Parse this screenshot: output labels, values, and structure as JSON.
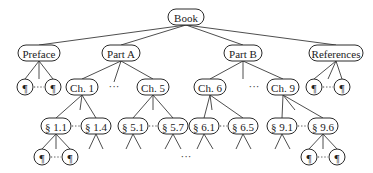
{
  "diagram": {
    "type": "tree",
    "colors": {
      "stroke": "#2a2a2a",
      "text": "#222222",
      "background": "#ffffff"
    },
    "root": {
      "id": "book",
      "label": "Book",
      "x": 186,
      "y": 17,
      "w": 36
    },
    "level1": [
      {
        "id": "preface",
        "label": "Preface",
        "x": 39,
        "y": 53,
        "w": 42
      },
      {
        "id": "part-a",
        "label": "Part A",
        "x": 121,
        "y": 53,
        "w": 38
      },
      {
        "id": "part-b",
        "label": "Part B",
        "x": 243,
        "y": 53,
        "w": 38
      },
      {
        "id": "references",
        "label": "References",
        "x": 336,
        "y": 53,
        "w": 54
      }
    ],
    "level2": [
      {
        "id": "pref-p1",
        "label": "¶",
        "x": 25,
        "y": 87,
        "w": 16
      },
      {
        "id": "pref-p2",
        "label": "¶",
        "x": 53,
        "y": 87,
        "w": 16
      },
      {
        "id": "ch1",
        "label": "Ch. 1",
        "x": 82,
        "y": 87,
        "w": 32
      },
      {
        "id": "ch5",
        "label": "Ch. 5",
        "x": 153,
        "y": 87,
        "w": 32
      },
      {
        "id": "ch6",
        "label": "Ch. 6",
        "x": 210,
        "y": 87,
        "w": 32
      },
      {
        "id": "ch9",
        "label": "Ch. 9",
        "x": 283,
        "y": 87,
        "w": 32
      },
      {
        "id": "ref-p1",
        "label": "¶",
        "x": 314,
        "y": 87,
        "w": 16
      },
      {
        "id": "ref-p2",
        "label": "¶",
        "x": 342,
        "y": 87,
        "w": 16
      }
    ],
    "level3": [
      {
        "id": "s1-1",
        "label": "§ 1.1",
        "x": 56,
        "y": 126,
        "w": 30
      },
      {
        "id": "s1-4",
        "label": "§ 1.4",
        "x": 96,
        "y": 126,
        "w": 30
      },
      {
        "id": "s5-1",
        "label": "§ 5.1",
        "x": 133,
        "y": 126,
        "w": 30
      },
      {
        "id": "s5-7",
        "label": "§ 5.7",
        "x": 173,
        "y": 126,
        "w": 30
      },
      {
        "id": "s6-1",
        "label": "§ 6.1",
        "x": 204,
        "y": 126,
        "w": 30
      },
      {
        "id": "s6-5",
        "label": "§ 6.5",
        "x": 243,
        "y": 126,
        "w": 30
      },
      {
        "id": "s9-1",
        "label": "§ 9.1",
        "x": 282,
        "y": 126,
        "w": 30
      },
      {
        "id": "s9-6",
        "label": "§ 9.6",
        "x": 323,
        "y": 126,
        "w": 30
      }
    ],
    "level4": [
      {
        "id": "s11-p1",
        "label": "¶",
        "x": 42,
        "y": 157,
        "w": 16
      },
      {
        "id": "s11-p2",
        "label": "¶",
        "x": 70,
        "y": 157,
        "w": 16
      },
      {
        "id": "s96-p1",
        "label": "¶",
        "x": 309,
        "y": 157,
        "w": 16
      },
      {
        "id": "s96-p2",
        "label": "¶",
        "x": 337,
        "y": 157,
        "w": 16
      }
    ],
    "ellipses": [
      {
        "id": "parta-dots",
        "label": "···",
        "x": 114,
        "y": 90
      },
      {
        "id": "partb-dots",
        "label": "···",
        "x": 254,
        "y": 90
      },
      {
        "id": "bottom-dots",
        "label": "···",
        "x": 186,
        "y": 160
      }
    ],
    "dotted_links": [
      {
        "from": "pref-p1",
        "to": "pref-p2"
      },
      {
        "from": "ref-p1",
        "to": "ref-p2"
      },
      {
        "from": "s1-1",
        "to": "s1-4"
      },
      {
        "from": "s5-1",
        "to": "s5-7"
      },
      {
        "from": "s6-1",
        "to": "s6-5"
      },
      {
        "from": "s9-1",
        "to": "s9-6"
      },
      {
        "from": "s11-p1",
        "to": "s11-p2"
      },
      {
        "from": "s96-p1",
        "to": "s96-p2"
      }
    ],
    "edges": [
      [
        "book",
        "preface"
      ],
      [
        "book",
        "part-a"
      ],
      [
        "book",
        "part-b"
      ],
      [
        "book",
        "references"
      ],
      [
        "preface",
        "pref-p1"
      ],
      [
        "preface",
        "pref-p2"
      ],
      [
        "part-a",
        "ch1"
      ],
      [
        "part-a",
        "ch5"
      ],
      [
        "part-b",
        "ch6"
      ],
      [
        "part-b",
        "ch9"
      ],
      [
        "references",
        "ref-p1"
      ],
      [
        "references",
        "ref-p2"
      ],
      [
        "ch1",
        "s1-1"
      ],
      [
        "ch1",
        "s1-4"
      ],
      [
        "ch5",
        "s5-1"
      ],
      [
        "ch5",
        "s5-7"
      ],
      [
        "ch6",
        "s6-1"
      ],
      [
        "ch6",
        "s6-5"
      ],
      [
        "ch9",
        "s9-1"
      ],
      [
        "ch9",
        "s9-6"
      ],
      [
        "s1-1",
        "s11-p1"
      ],
      [
        "s1-1",
        "s11-p2"
      ],
      [
        "s9-6",
        "s96-p1"
      ],
      [
        "s9-6",
        "s96-p2"
      ]
    ],
    "stub_edges": [
      {
        "x1": 39,
        "y1": 61,
        "x2": 39,
        "y2": 79
      },
      {
        "x1": 121,
        "y1": 61,
        "x2": 114,
        "y2": 82
      },
      {
        "x1": 243,
        "y1": 61,
        "x2": 243,
        "y2": 79
      },
      {
        "x1": 336,
        "y1": 61,
        "x2": 328,
        "y2": 79
      },
      {
        "x1": 82,
        "y1": 95,
        "x2": 80,
        "y2": 110
      },
      {
        "x1": 153,
        "y1": 95,
        "x2": 153,
        "y2": 110
      },
      {
        "x1": 210,
        "y1": 95,
        "x2": 212,
        "y2": 110
      },
      {
        "x1": 283,
        "y1": 95,
        "x2": 295,
        "y2": 110
      },
      {
        "x1": 56,
        "y1": 134,
        "x2": 56,
        "y2": 149
      },
      {
        "x1": 323,
        "y1": 134,
        "x2": 323,
        "y2": 149
      },
      {
        "x1": 96,
        "y1": 134,
        "x2": 89,
        "y2": 149
      },
      {
        "x1": 96,
        "y1": 134,
        "x2": 103,
        "y2": 149
      },
      {
        "x1": 133,
        "y1": 134,
        "x2": 126,
        "y2": 149
      },
      {
        "x1": 133,
        "y1": 134,
        "x2": 141,
        "y2": 149
      },
      {
        "x1": 173,
        "y1": 134,
        "x2": 165,
        "y2": 149
      },
      {
        "x1": 173,
        "y1": 134,
        "x2": 181,
        "y2": 149
      },
      {
        "x1": 204,
        "y1": 134,
        "x2": 197,
        "y2": 149
      },
      {
        "x1": 204,
        "y1": 134,
        "x2": 213,
        "y2": 149
      },
      {
        "x1": 243,
        "y1": 134,
        "x2": 236,
        "y2": 149
      },
      {
        "x1": 243,
        "y1": 134,
        "x2": 251,
        "y2": 149
      },
      {
        "x1": 282,
        "y1": 134,
        "x2": 275,
        "y2": 149
      },
      {
        "x1": 282,
        "y1": 134,
        "x2": 290,
        "y2": 149
      }
    ]
  }
}
